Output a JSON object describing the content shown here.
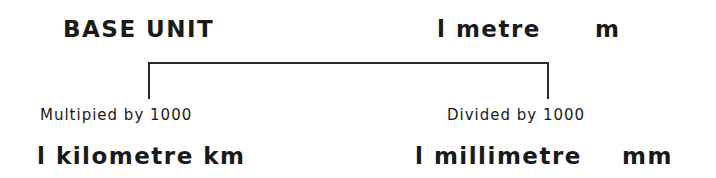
{
  "header": {
    "base_label": "BASE UNIT",
    "base_value": "l metre",
    "base_symbol": "m"
  },
  "branches": [
    {
      "operation": "Multipied by 1000",
      "result": "l kilometre km"
    },
    {
      "operation": "Divided by 1000",
      "result": "l millimetre",
      "symbol": "mm"
    }
  ]
}
